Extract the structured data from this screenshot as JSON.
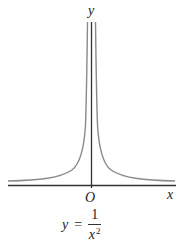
{
  "figure": {
    "type": "function-graph",
    "axes": {
      "x_label": "x",
      "y_label": "y",
      "origin_label": "O"
    },
    "equation": {
      "lhs": "y",
      "equals": "=",
      "numerator": "1",
      "denominator_base": "x",
      "denominator_exponent": "2"
    },
    "colors": {
      "axis": "#333333",
      "curve": "#8a8a8a",
      "text": "#222222",
      "background": "#ffffff"
    }
  }
}
